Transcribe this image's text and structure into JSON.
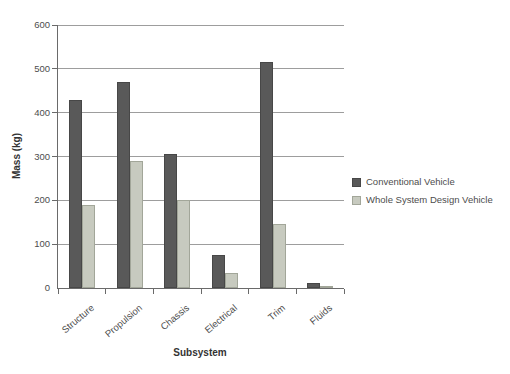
{
  "chart_data": {
    "type": "bar",
    "title": "",
    "categories": [
      "Structure",
      "Propulsion",
      "Chassis",
      "Electrical",
      "Trim",
      "Fluids"
    ],
    "series": [
      {
        "name": "Conventional Vehicle",
        "color": "#595959",
        "border_color": "#474747",
        "values": [
          430,
          470,
          305,
          75,
          515,
          12
        ]
      },
      {
        "name": "Whole System Design Vehicle",
        "color": "#C7CABF",
        "border_color": "#A2A699",
        "values": [
          190,
          290,
          200,
          35,
          145,
          5
        ]
      }
    ],
    "xlabel": "Subsystem",
    "ylabel": "Mass (kg)",
    "ylim": [
      0,
      600
    ],
    "yticks": [
      0,
      100,
      200,
      300,
      400,
      500,
      600
    ],
    "grid": true,
    "legend_position": "right"
  },
  "styles": {
    "grid_color": "#9d9d9d",
    "axis_color": "#6a6a6a",
    "background": "#ffffff"
  }
}
